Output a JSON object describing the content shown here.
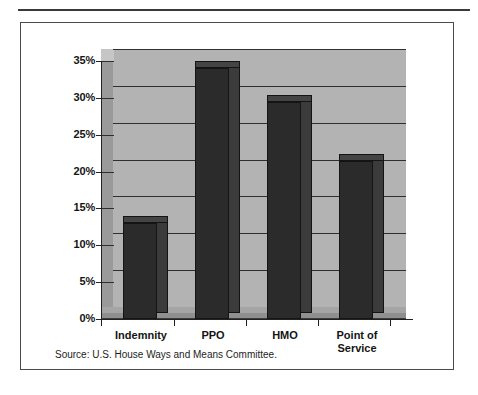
{
  "figure": {
    "source_note": "Source:  U.S. House Ways and Means Committee."
  },
  "chart_data": {
    "type": "bar",
    "title": "",
    "subtitle": "",
    "xlabel": "",
    "ylabel": "",
    "categories": [
      "Indemnity",
      "PPO",
      "HMO",
      "Point of\nService"
    ],
    "values": [
      13,
      34,
      29.5,
      21.5
    ],
    "value_labels": [
      "13%",
      "34%",
      "29.5%",
      "21.5%"
    ],
    "ylim": [
      0,
      35
    ],
    "ytick_values": [
      0,
      5,
      10,
      15,
      20,
      25,
      30,
      35
    ],
    "ytick_labels": [
      "0%",
      "5%",
      "10%",
      "15%",
      "20%",
      "25%",
      "30%",
      "35%"
    ],
    "grid": true,
    "grid_axis": "y",
    "legend": "none",
    "style": "3d-column",
    "colors": {
      "bar_front": "#2b2b2b",
      "bar_side": "#3b3b3b",
      "bar_top": "#444444",
      "plot_background": "#b3b3b3",
      "wall_side": "#9a9a9a",
      "floor": "#8f8f8f",
      "gridline": "#2f2f2f",
      "axis": "#222222",
      "frame": "#4a4a4a",
      "text": "#141414"
    }
  }
}
